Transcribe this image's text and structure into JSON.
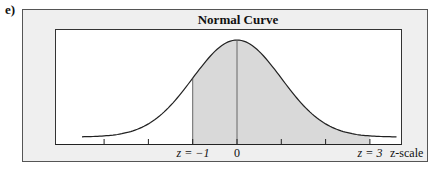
{
  "panel_label": "e)",
  "chart_data": {
    "type": "area",
    "title": "Normal Curve",
    "xlabel": "z-scale",
    "ylabel": "",
    "distribution": "standard normal",
    "x_range": [
      -3.5,
      3.6
    ],
    "tick_positions": [
      -3,
      -2,
      -1,
      0,
      1,
      2,
      3
    ],
    "tick_labels": [
      {
        "z": -1,
        "text": "z = −1"
      },
      {
        "z": 0,
        "text": "0"
      },
      {
        "z": 3,
        "text": "z = 3"
      }
    ],
    "shaded_region": {
      "from": -1,
      "to": 3
    },
    "center_line": 0,
    "grid": false,
    "legend": null,
    "colors": {
      "frame_bg": "#efefef",
      "plot_bg": "#ffffff",
      "shade": "#d9d9d9",
      "line": "#222222"
    }
  },
  "labels": {
    "title": "Normal Curve",
    "z_minus1": "z = −1",
    "zero": "0",
    "z_3": "z = 3",
    "scale": "z-scale"
  }
}
